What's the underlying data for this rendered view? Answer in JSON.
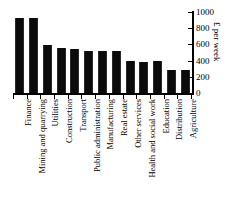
{
  "chart_data": {
    "type": "bar",
    "title": "",
    "subtitle": "",
    "xlabel": "",
    "ylabel": "£ per week",
    "ylim": [
      0,
      1000
    ],
    "yticks": [
      0,
      200,
      400,
      600,
      800,
      1000
    ],
    "ytick_labels": [
      "0",
      "200",
      "400",
      "600",
      "800",
      "1000"
    ],
    "y_axis_position": "right",
    "grid": false,
    "legend": false,
    "bar_color": "#0b0b0b",
    "categories": [
      "Finance",
      "Mining and quarrying",
      "Utilities",
      "Construction",
      "Transport",
      "Public administration",
      "Manufacturing",
      "Real estate",
      "Other services",
      "Health and social work",
      "Education",
      "Distribution",
      "Agriculture"
    ],
    "values": [
      930,
      925,
      590,
      550,
      540,
      520,
      515,
      520,
      395,
      385,
      395,
      290,
      285
    ]
  }
}
